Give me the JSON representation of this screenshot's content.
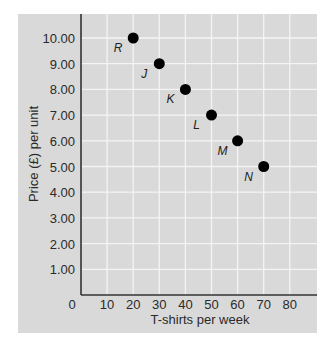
{
  "chart_data": {
    "type": "scatter",
    "title": "",
    "xlabel": "T-shirts per week",
    "ylabel": "Price (£) per unit",
    "xlim": [
      0,
      90
    ],
    "ylim": [
      0,
      11
    ],
    "grid": true,
    "legend": null,
    "x_ticks": [
      "0",
      "10",
      "20",
      "30",
      "40",
      "50",
      "60",
      "70",
      "80"
    ],
    "y_ticks": [
      "1.00",
      "2.00",
      "3.00",
      "4.00",
      "5.00",
      "6.00",
      "7.00",
      "8.00",
      "9.00",
      "10.00"
    ],
    "points": [
      {
        "label": "R",
        "x": 20,
        "y": 10.0
      },
      {
        "label": "J",
        "x": 30,
        "y": 9.0
      },
      {
        "label": "K",
        "x": 40,
        "y": 8.0
      },
      {
        "label": "L",
        "x": 50,
        "y": 7.0
      },
      {
        "label": "M",
        "x": 60,
        "y": 6.0
      },
      {
        "label": "N",
        "x": 70,
        "y": 5.0
      }
    ],
    "colors": {
      "panel": "#d9d9d9",
      "grid": "#f4f4f4",
      "axis": "#333333",
      "point": "#000000"
    }
  }
}
